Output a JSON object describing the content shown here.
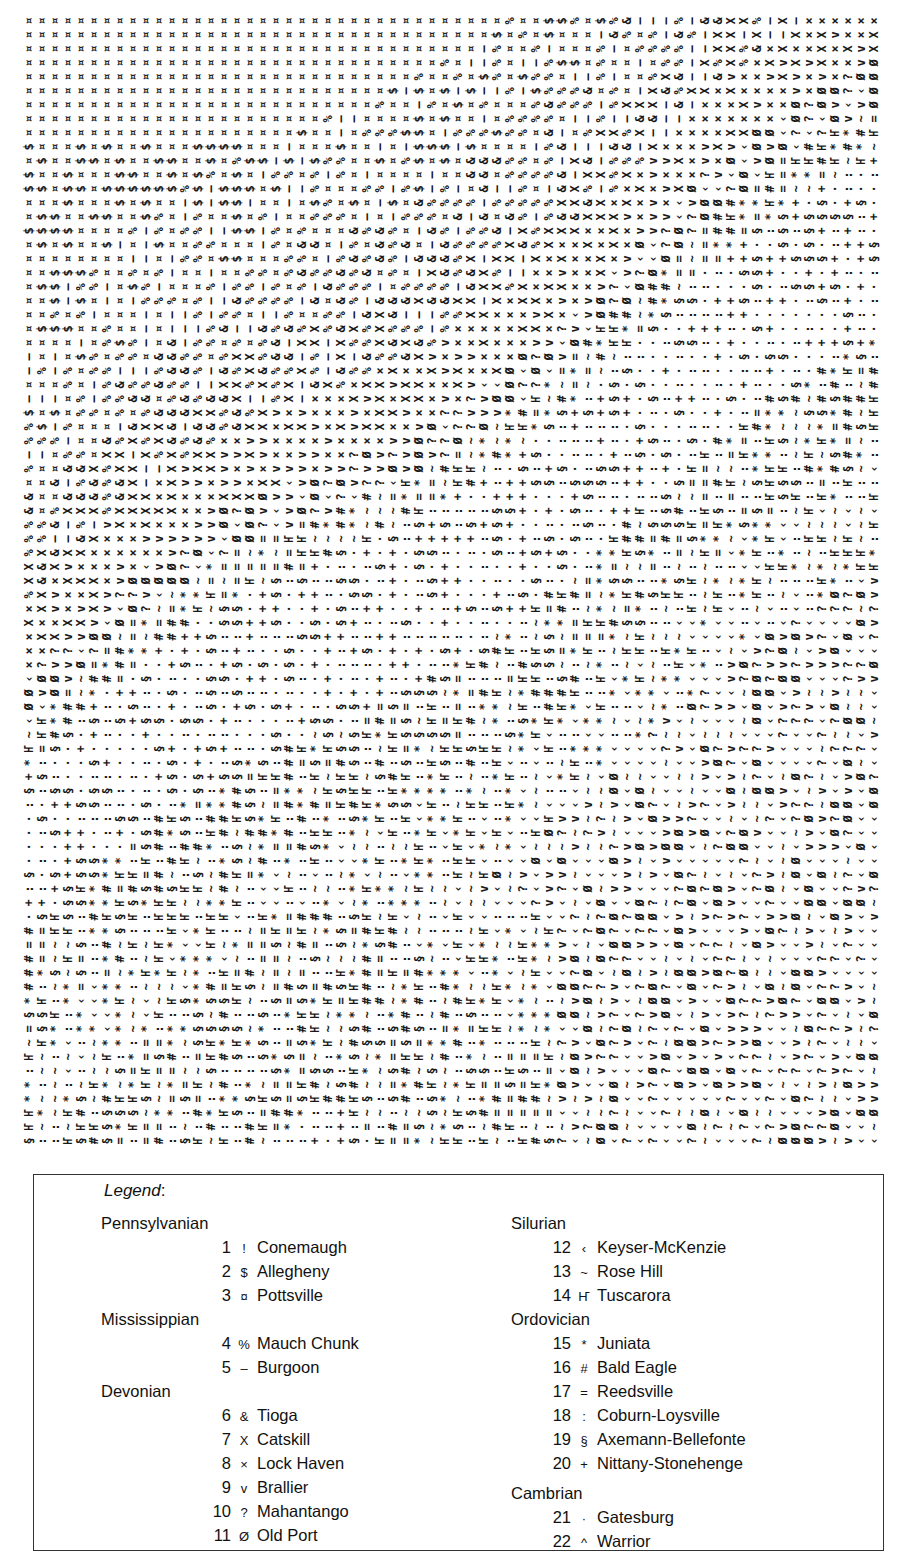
{
  "map": {
    "grid": {
      "cols": 66,
      "rows": 81,
      "cell_w": 13,
      "cell_h": 14
    },
    "description": "Character-printed geologic map; columns of rotated symbols",
    "zones_note": "Bands run diagonally from upper-left (youngest) to lower-right (oldest)"
  },
  "legend": {
    "title": "Legend",
    "title_colon": ":",
    "left_column": [
      {
        "period": "Pennsylvanian",
        "units": [
          {
            "num": "1",
            "symbol": "!",
            "name": "Conemaugh"
          },
          {
            "num": "2",
            "symbol": "$",
            "name": "Allegheny"
          },
          {
            "num": "3",
            "symbol": "¤",
            "name": "Pottsville"
          }
        ]
      },
      {
        "period": "Mississippian",
        "units": [
          {
            "num": "4",
            "symbol": "%",
            "name": "Mauch Chunk"
          },
          {
            "num": "5",
            "symbol": "–",
            "name": "Burgoon"
          }
        ]
      },
      {
        "period": "Devonian",
        "units": [
          {
            "num": "6",
            "symbol": "&",
            "name": "Tioga"
          },
          {
            "num": "7",
            "symbol": "X",
            "name": "Catskill"
          },
          {
            "num": "8",
            "symbol": "×",
            "name": "Lock Haven"
          },
          {
            "num": "9",
            "symbol": "v",
            "name": "Brallier"
          },
          {
            "num": "10",
            "symbol": "?",
            "name": "Mahantango"
          },
          {
            "num": "11",
            "symbol": "Ø",
            "name": "Old Port"
          }
        ]
      }
    ],
    "right_column": [
      {
        "period": "Silurian",
        "units": [
          {
            "num": "12",
            "symbol": "‹",
            "name": "Keyser-McKenzie"
          },
          {
            "num": "13",
            "symbol": "~",
            "name": "Rose Hill"
          },
          {
            "num": "14",
            "symbol": "Ҥ",
            "name": "Tuscarora"
          }
        ]
      },
      {
        "period": "Ordovician",
        "units": [
          {
            "num": "15",
            "symbol": "*",
            "name": "Juniata"
          },
          {
            "num": "16",
            "symbol": "#",
            "name": "Bald Eagle"
          },
          {
            "num": "17",
            "symbol": "=",
            "name": "Reedsville"
          },
          {
            "num": "18",
            "symbol": ":",
            "name": "Coburn-Loysville"
          },
          {
            "num": "19",
            "symbol": "§",
            "name": "Axemann-Bellefonte"
          },
          {
            "num": "20",
            "symbol": "+",
            "name": "Nittany-Stonehenge"
          }
        ]
      },
      {
        "period": "Cambrian",
        "units": [
          {
            "num": "21",
            "symbol": "·",
            "name": "Gatesburg"
          },
          {
            "num": "22",
            "symbol": "^",
            "name": "Warrior"
          }
        ]
      }
    ]
  }
}
